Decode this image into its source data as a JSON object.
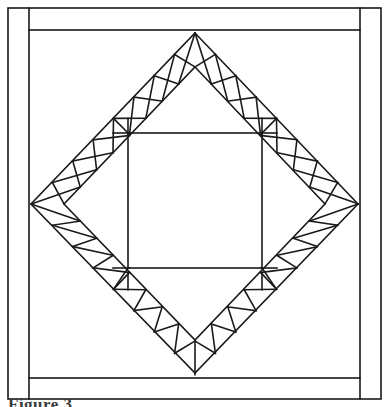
{
  "figure": {
    "caption": "Figure 3",
    "line_color": "#1a1a1a",
    "fill_color": "#ffffff",
    "background_color": "#ffffff"
  },
  "geometry": {
    "canvas": {
      "width": 389,
      "height": 407
    },
    "outer_frame": {
      "x1": 8,
      "y1": 8,
      "x2": 381,
      "y2": 399,
      "stroke_width": 1.6
    },
    "inner_frame": {
      "x1": 29,
      "y1": 30,
      "x2": 360,
      "y2": 378,
      "stroke_width": 1.6
    },
    "diamond": {
      "top": [
        195,
        33
      ],
      "right": [
        358,
        204
      ],
      "bottom": [
        195,
        373
      ],
      "left": [
        31,
        204
      ],
      "stroke_width": 1.6
    },
    "band_inner": {
      "top": [
        195,
        67
      ],
      "right": [
        325,
        204
      ],
      "bottom": [
        195,
        340
      ],
      "left": [
        64,
        204
      ],
      "stroke_width": 1.6
    },
    "inner_square": {
      "x1": 128,
      "y1": 133,
      "x2": 262,
      "y2": 268,
      "stroke_width": 1.6
    },
    "corner_square_size": 21,
    "sawtooth_units_per_edge": 8
  },
  "labels": {
    "outer_border": "outer border",
    "inner_border": "inner border",
    "sawtooth_band": "sawtooth triangle band",
    "center_square": "center square",
    "diamond_outline": "diamond on point"
  }
}
